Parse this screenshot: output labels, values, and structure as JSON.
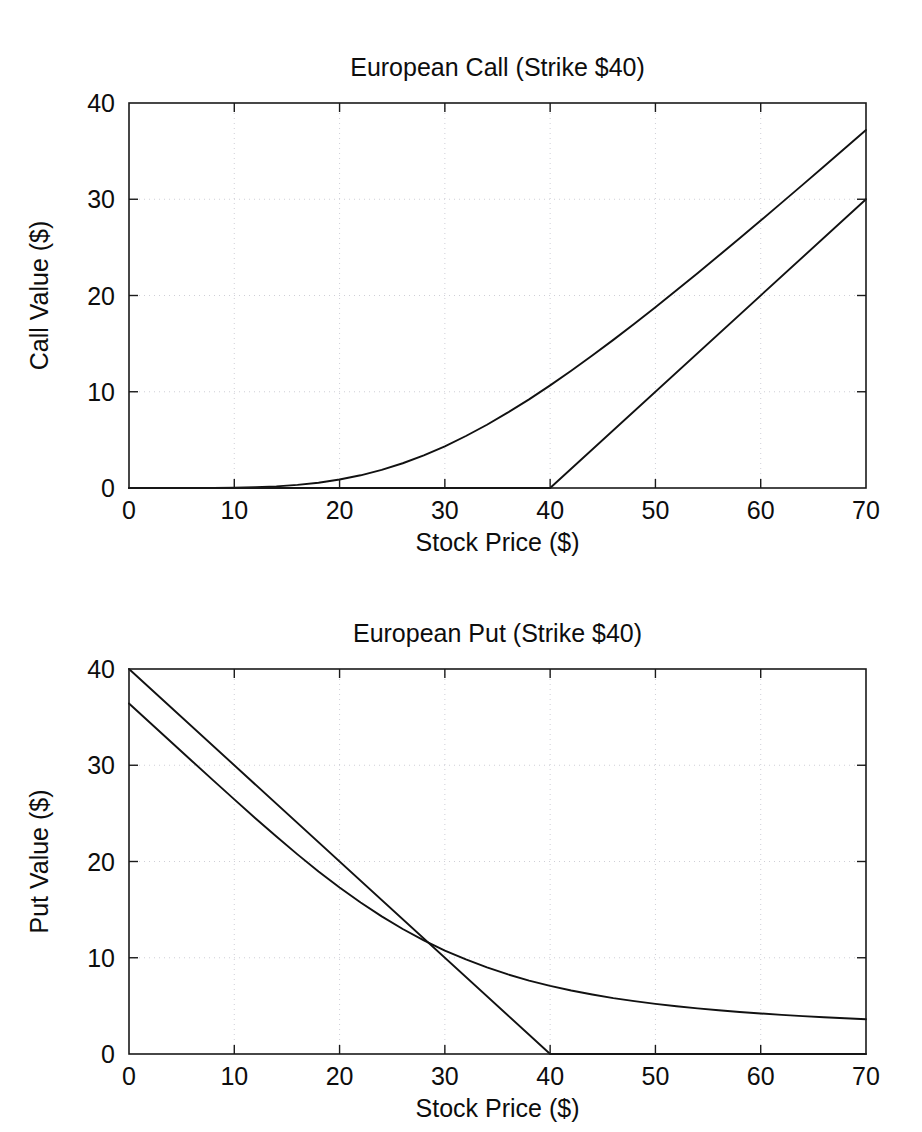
{
  "figure": {
    "background": "#ffffff",
    "line_color": "#111111",
    "grid_color": "#c9c9d2",
    "axis_color": "#1a1a1a"
  },
  "chart_data": [
    {
      "type": "line",
      "title": "European Call (Strike $40)",
      "xlabel": "Stock Price ($)",
      "ylabel": "Call Value ($)",
      "xlim": [
        0,
        70
      ],
      "ylim": [
        0,
        40
      ],
      "xticks": [
        0,
        10,
        20,
        30,
        40,
        50,
        60,
        70
      ],
      "yticks": [
        0,
        10,
        20,
        30,
        40
      ],
      "xticklabels": [
        "0",
        "10",
        "20",
        "30",
        "40",
        "50",
        "60",
        "70"
      ],
      "yticklabels": [
        "0",
        "10",
        "20",
        "30",
        "40"
      ],
      "grid": true,
      "legend": "none",
      "strike": 40,
      "series": [
        {
          "name": "Black-Scholes call value",
          "x": [
            0,
            2,
            4,
            6,
            8,
            10,
            12,
            14,
            16,
            18,
            20,
            22,
            24,
            26,
            28,
            30,
            32,
            34,
            36,
            38,
            40,
            42,
            44,
            46,
            48,
            50,
            52,
            54,
            56,
            58,
            60,
            62,
            64,
            66,
            68,
            70
          ],
          "values": [
            0,
            0,
            0,
            0,
            0.01,
            0.03,
            0.08,
            0.17,
            0.32,
            0.55,
            0.88,
            1.32,
            1.88,
            2.57,
            3.39,
            4.33,
            5.4,
            6.57,
            7.85,
            9.21,
            10.66,
            12.18,
            13.76,
            15.39,
            17.07,
            18.79,
            20.54,
            22.32,
            24.12,
            25.95,
            27.79,
            29.65,
            31.52,
            33.4,
            35.29,
            37.19
          ]
        },
        {
          "name": "Call payoff at expiry",
          "x": [
            0,
            40,
            70
          ],
          "values": [
            0,
            0,
            30
          ]
        }
      ]
    },
    {
      "type": "line",
      "title": "European Put (Strike $40)",
      "xlabel": "Stock Price ($)",
      "ylabel": "Put Value ($)",
      "xlim": [
        0,
        70
      ],
      "ylim": [
        0,
        40
      ],
      "xticks": [
        0,
        10,
        20,
        30,
        40,
        50,
        60,
        70
      ],
      "yticks": [
        0,
        10,
        20,
        30,
        40
      ],
      "xticklabels": [
        "0",
        "10",
        "20",
        "30",
        "40",
        "50",
        "60",
        "70"
      ],
      "yticklabels": [
        "0",
        "10",
        "20",
        "30",
        "40"
      ],
      "grid": true,
      "legend": "none",
      "strike": 40,
      "series": [
        {
          "name": "Put payoff at expiry",
          "x": [
            0,
            40,
            70
          ],
          "values": [
            40,
            0,
            0
          ]
        },
        {
          "name": "Black-Scholes put value",
          "x": [
            0,
            2,
            4,
            6,
            8,
            10,
            12,
            14,
            16,
            18,
            20,
            22,
            24,
            26,
            28,
            30,
            32,
            34,
            36,
            38,
            40,
            42,
            44,
            46,
            48,
            50,
            52,
            54,
            56,
            58,
            60,
            62,
            64,
            66,
            68,
            70
          ],
          "values": [
            36.42,
            34.42,
            32.42,
            30.42,
            28.43,
            26.45,
            24.5,
            22.59,
            20.74,
            18.97,
            17.3,
            15.74,
            14.3,
            12.99,
            11.81,
            10.75,
            9.82,
            8.99,
            8.27,
            7.63,
            7.08,
            6.6,
            6.18,
            5.81,
            5.49,
            5.21,
            4.96,
            4.74,
            4.54,
            4.37,
            4.21,
            4.07,
            3.94,
            3.82,
            3.71,
            3.61
          ]
        }
      ]
    }
  ],
  "panels": [
    {
      "title": "European Call (Strike $40)",
      "xlabel": "Stock Price ($)",
      "ylabel": "Call Value ($)"
    },
    {
      "title": "European Put (Strike $40)",
      "xlabel": "Stock Price ($)",
      "ylabel": "Put Value ($)"
    }
  ]
}
